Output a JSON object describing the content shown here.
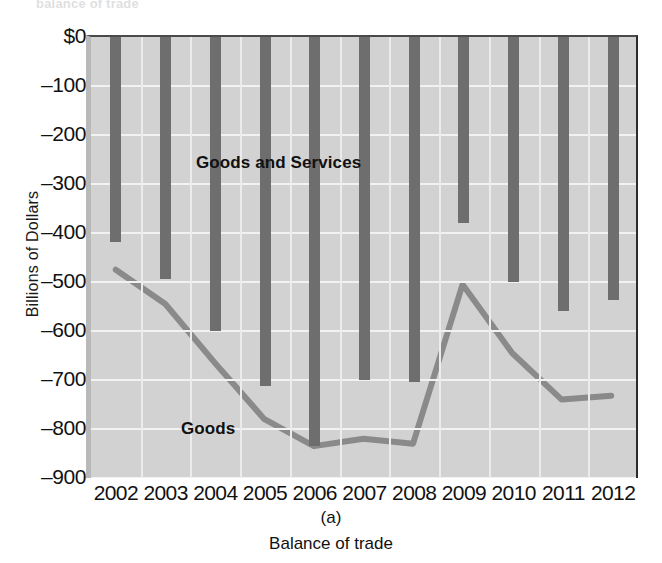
{
  "figure": {
    "top_cut_text": "balance of trade",
    "caption_index": "(a)",
    "caption_title": "Balance of trade",
    "y_axis_title": "Billions of Dollars",
    "label_series_bar": "Goods and Services",
    "label_series_line": "Goods"
  },
  "chart_data": {
    "type": "bar",
    "title": "Balance of trade",
    "subtitle": "(a)",
    "xlabel": "",
    "ylabel": "Billions of Dollars",
    "categories": [
      "2002",
      "2003",
      "2004",
      "2005",
      "2006",
      "2007",
      "2008",
      "2009",
      "2010",
      "2011",
      "2012"
    ],
    "ylim": [
      -900,
      0
    ],
    "ytick_labels": [
      "$0",
      "–100",
      "–200",
      "–300",
      "–400",
      "–500",
      "–600",
      "–700",
      "–800",
      "–900"
    ],
    "ytick_values": [
      0,
      -100,
      -200,
      -300,
      -400,
      -500,
      -600,
      -700,
      -800,
      -900
    ],
    "grid": true,
    "legend": "in-plot labels",
    "series": [
      {
        "name": "Goods and Services",
        "type": "bar",
        "color": "#6e6e6e",
        "values": [
          -418,
          -494,
          -601,
          -712,
          -835,
          -700,
          -705,
          -380,
          -500,
          -560,
          -537
        ]
      },
      {
        "name": "Goods",
        "type": "line",
        "color": "#8a8a8a",
        "values": [
          -475,
          -545,
          -665,
          -780,
          -835,
          -820,
          -830,
          -505,
          -645,
          -740,
          -732
        ]
      }
    ]
  }
}
